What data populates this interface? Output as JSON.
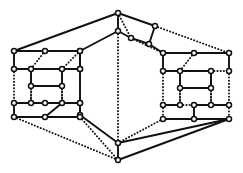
{
  "figure": {
    "width": 243,
    "height": 173,
    "background_color": "#ffffff",
    "ink_color": "#111111"
  },
  "style": {
    "solid_edge_width": 1.9,
    "dotted_edge_width": 1.9,
    "dotted_dash_pattern": "0.2 3.0",
    "vertex_radius": 2.5,
    "vertex_stroke_width": 1.5,
    "vertex_fill": "#ffffff",
    "vertex_stroke": "#111111"
  },
  "graph": {
    "vertex_count": 50,
    "solid_edge_count": 47,
    "dotted_edge_count": 28,
    "nodes": [
      {
        "id": "n0",
        "label": "apex-top",
        "x": 118,
        "y": 13
      },
      {
        "id": "n1",
        "label": "apex-inner",
        "x": 118,
        "y": 31
      },
      {
        "id": "n2",
        "label": "ridge-right-a",
        "x": 155,
        "y": 26
      },
      {
        "id": "n3",
        "label": "ridge-right-b",
        "x": 149,
        "y": 44
      },
      {
        "id": "n4",
        "label": "ridge-mid",
        "x": 131,
        "y": 38
      },
      {
        "id": "n5",
        "label": "spine-a",
        "x": 80,
        "y": 51
      },
      {
        "id": "n6",
        "label": "spine-b",
        "x": 80,
        "y": 69
      },
      {
        "id": "n7",
        "label": "spine-c",
        "x": 80,
        "y": 103
      },
      {
        "id": "n8",
        "label": "spine-d",
        "x": 80,
        "y": 115
      },
      {
        "id": "n9",
        "label": "base-upper",
        "x": 118,
        "y": 143
      },
      {
        "id": "n10",
        "label": "base-lower",
        "x": 118,
        "y": 160
      },
      {
        "id": "L0",
        "label": "left-r1-c1",
        "x": 14,
        "y": 51
      },
      {
        "id": "L1",
        "label": "left-r1-c2",
        "x": 45,
        "y": 51
      },
      {
        "id": "L2",
        "label": "left-r1-c3",
        "x": 80,
        "y": 51
      },
      {
        "id": "L3",
        "label": "left-r2-c1",
        "x": 14,
        "y": 69
      },
      {
        "id": "L4",
        "label": "left-r2-c2",
        "x": 31,
        "y": 69
      },
      {
        "id": "L5",
        "label": "left-r2-c3",
        "x": 62,
        "y": 69
      },
      {
        "id": "L6",
        "label": "left-r2-c4",
        "x": 80,
        "y": 69
      },
      {
        "id": "L7",
        "label": "left-r3-c1",
        "x": 31,
        "y": 86
      },
      {
        "id": "L8",
        "label": "left-r3-c2",
        "x": 62,
        "y": 86
      },
      {
        "id": "L9",
        "label": "left-r4-c1",
        "x": 14,
        "y": 103
      },
      {
        "id": "L10",
        "label": "left-r4-c2",
        "x": 31,
        "y": 103
      },
      {
        "id": "L11",
        "label": "left-r4-c3",
        "x": 45,
        "y": 103
      },
      {
        "id": "L12",
        "label": "left-r4-c4",
        "x": 62,
        "y": 103
      },
      {
        "id": "L13",
        "label": "left-r4-c5",
        "x": 80,
        "y": 103
      },
      {
        "id": "L14",
        "label": "left-r5-c1",
        "x": 14,
        "y": 117
      },
      {
        "id": "L15",
        "label": "left-r5-c2",
        "x": 45,
        "y": 117
      },
      {
        "id": "L16",
        "label": "left-r5-c3",
        "x": 80,
        "y": 117
      },
      {
        "id": "R0",
        "label": "right-r1-c1",
        "x": 163,
        "y": 53
      },
      {
        "id": "R1",
        "label": "right-r1-c2",
        "x": 194,
        "y": 53
      },
      {
        "id": "R2",
        "label": "right-r1-c3",
        "x": 229,
        "y": 53
      },
      {
        "id": "R3",
        "label": "right-r2-c1",
        "x": 163,
        "y": 71
      },
      {
        "id": "R4",
        "label": "right-r2-c2",
        "x": 180,
        "y": 71
      },
      {
        "id": "R5",
        "label": "right-r2-c3",
        "x": 211,
        "y": 71
      },
      {
        "id": "R6",
        "label": "right-r2-c4",
        "x": 229,
        "y": 71
      },
      {
        "id": "R7",
        "label": "right-r3-c1",
        "x": 180,
        "y": 88
      },
      {
        "id": "R8",
        "label": "right-r3-c2",
        "x": 211,
        "y": 88
      },
      {
        "id": "R9",
        "label": "right-r4-c1",
        "x": 163,
        "y": 105
      },
      {
        "id": "R10",
        "label": "right-r4-c2",
        "x": 180,
        "y": 105
      },
      {
        "id": "R11",
        "label": "right-r4-c3",
        "x": 194,
        "y": 105
      },
      {
        "id": "R12",
        "label": "right-r4-c4",
        "x": 211,
        "y": 105
      },
      {
        "id": "R13",
        "label": "right-r4-c5",
        "x": 229,
        "y": 105
      },
      {
        "id": "R14",
        "label": "right-r5-c1",
        "x": 163,
        "y": 119
      },
      {
        "id": "R15",
        "label": "right-r5-c2",
        "x": 194,
        "y": 119
      },
      {
        "id": "R16",
        "label": "right-r5-c3",
        "x": 229,
        "y": 119
      }
    ],
    "solid_edges": [
      [
        "n0",
        "n1"
      ],
      [
        "n0",
        "n2"
      ],
      [
        "n0",
        "L0"
      ],
      [
        "n1",
        "n4"
      ],
      [
        "n1",
        "n5"
      ],
      [
        "n2",
        "n3"
      ],
      [
        "n3",
        "n4"
      ],
      [
        "n3",
        "R0"
      ],
      [
        "n5",
        "n6"
      ],
      [
        "n6",
        "n7"
      ],
      [
        "n7",
        "n8"
      ],
      [
        "n8",
        "n9"
      ],
      [
        "n9",
        "n10"
      ],
      [
        "n9",
        "R16"
      ],
      [
        "n10",
        "R16"
      ],
      [
        "L0",
        "L1"
      ],
      [
        "L1",
        "L2"
      ],
      [
        "L0",
        "L3"
      ],
      [
        "L3",
        "L4"
      ],
      [
        "L4",
        "L5"
      ],
      [
        "L5",
        "L6"
      ],
      [
        "L2",
        "L6"
      ],
      [
        "L4",
        "L7"
      ],
      [
        "L7",
        "L8"
      ],
      [
        "L8",
        "L5"
      ],
      [
        "L9",
        "L10"
      ],
      [
        "L10",
        "L11"
      ],
      [
        "L11",
        "L12"
      ],
      [
        "L12",
        "L13"
      ],
      [
        "L9",
        "L14"
      ],
      [
        "L14",
        "L15"
      ],
      [
        "L15",
        "L16"
      ],
      [
        "L12",
        "L15"
      ],
      [
        "L13",
        "L16"
      ],
      [
        "R0",
        "R1"
      ],
      [
        "R1",
        "R2"
      ],
      [
        "R0",
        "R3"
      ],
      [
        "R3",
        "R4"
      ],
      [
        "R4",
        "R5"
      ],
      [
        "R2",
        "R6"
      ],
      [
        "R4",
        "R7"
      ],
      [
        "R7",
        "R8"
      ],
      [
        "R8",
        "R5"
      ],
      [
        "R9",
        "R10"
      ],
      [
        "R11",
        "R12"
      ],
      [
        "R12",
        "R13"
      ],
      [
        "R14",
        "R15"
      ],
      [
        "R15",
        "R16"
      ],
      [
        "R11",
        "R15"
      ]
    ],
    "dotted_edges": [
      [
        "n0",
        "n4"
      ],
      [
        "n1",
        "n9"
      ],
      [
        "n2",
        "R2"
      ],
      [
        "n4",
        "R0"
      ],
      [
        "n5",
        "n6"
      ],
      [
        "n7",
        "n8"
      ],
      [
        "L0",
        "L1"
      ],
      [
        "L1",
        "L2"
      ],
      [
        "L1",
        "L4"
      ],
      [
        "L2",
        "L5"
      ],
      [
        "L3",
        "L9"
      ],
      [
        "L4",
        "L10"
      ],
      [
        "L5",
        "L12"
      ],
      [
        "L6",
        "L13"
      ],
      [
        "L7",
        "L10"
      ],
      [
        "L8",
        "L12"
      ],
      [
        "L10",
        "L11"
      ],
      [
        "L13",
        "L16"
      ],
      [
        "L14",
        "n10"
      ],
      [
        "L16",
        "n10"
      ],
      [
        "R1",
        "R4"
      ],
      [
        "R5",
        "R6"
      ],
      [
        "R3",
        "R9"
      ],
      [
        "R4",
        "R10"
      ],
      [
        "R5",
        "R12"
      ],
      [
        "R6",
        "R13"
      ],
      [
        "R7",
        "R10"
      ],
      [
        "R8",
        "R12"
      ],
      [
        "R10",
        "R11"
      ],
      [
        "R13",
        "R16"
      ],
      [
        "R9",
        "R14"
      ],
      [
        "R14",
        "n9"
      ]
    ]
  }
}
